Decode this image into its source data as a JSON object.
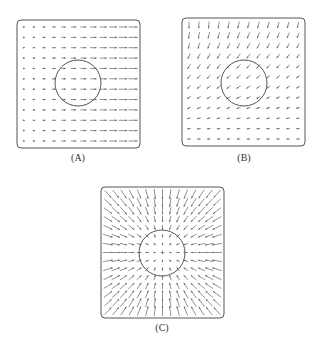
{
  "figure": {
    "panels": [
      {
        "id": "A",
        "label": "(A)",
        "field_type": "uniform-rightward-increasing",
        "description": "Arrows point right, lengthening toward the right side",
        "box": {
          "x": 17,
          "y": 20,
          "w": 123,
          "h": 128
        },
        "circle": {
          "cx": 78,
          "cy": 83,
          "r": 23
        },
        "grid": {
          "cols": 12,
          "rows": 12
        },
        "caption_pos": {
          "x": 78,
          "y": 152
        }
      },
      {
        "id": "B",
        "label": "(B)",
        "field_type": "rotating-downward-to-leftward",
        "description": "Arrows point down on the top-left, rotating to point left near the bottom; longer at top",
        "box": {
          "x": 182,
          "y": 18,
          "w": 123,
          "h": 128
        },
        "circle": {
          "cx": 244,
          "cy": 83,
          "r": 23
        },
        "grid": {
          "cols": 12,
          "rows": 12
        },
        "caption_pos": {
          "x": 244,
          "y": 152
        }
      },
      {
        "id": "C",
        "label": "(C)",
        "field_type": "radial-inward",
        "description": "Arrows point radially inward toward the center; lengths grow with distance from center",
        "box": {
          "x": 101,
          "y": 187,
          "w": 123,
          "h": 131
        },
        "circle": {
          "cx": 162,
          "cy": 253,
          "r": 23
        },
        "grid": {
          "cols": 15,
          "rows": 15
        },
        "caption_pos": {
          "x": 162,
          "y": 322
        }
      }
    ],
    "colors": {
      "stroke": "#555555",
      "arrow": "#666666",
      "background": "#ffffff"
    }
  }
}
